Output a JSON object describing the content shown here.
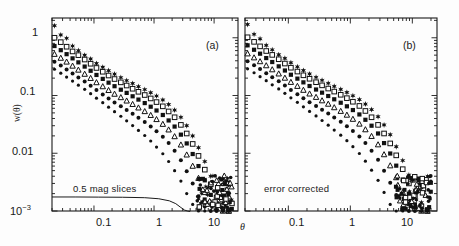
{
  "figure": {
    "background": "#fdfdfd",
    "axis_color": "#1a1a1a",
    "marker_color": "#111111",
    "ylabel": "w(θ)",
    "xlabel": "θ",
    "panel_a_tag": "(a)",
    "panel_b_tag": "(b)",
    "panel_a_annotation": "0.5 mag slices",
    "panel_b_annotation": "error corrected"
  },
  "chart_data": [
    {
      "type": "scatter",
      "panel": "a",
      "title": "",
      "subtitle": "0.5 mag slices",
      "xlabel": "θ",
      "ylabel": "w(θ)",
      "xscale": "log",
      "yscale": "log",
      "xlim": [
        0.02,
        25
      ],
      "ylim": [
        0.001,
        2.2
      ],
      "xtick_labels": [
        "0.1",
        "1",
        "10"
      ],
      "xtick_values": [
        0.1,
        1,
        10
      ],
      "ytick_labels": [
        "1",
        "0.1",
        "0.01",
        "10⁻³"
      ],
      "ytick_values": [
        1,
        0.1,
        0.01,
        0.001
      ],
      "grid": false,
      "legend": "none",
      "annotations": [
        {
          "text": "(a)",
          "x": 6.0,
          "y": 1.1
        },
        {
          "text": "0.5 mag slices",
          "x": 0.075,
          "y": 0.0021
        }
      ],
      "curve_overlay": {
        "name": "random-error-floor",
        "description": "smooth solid line near the bottom of panel (a)",
        "x": [
          0.02,
          0.05,
          0.12,
          0.3,
          0.7,
          1.2,
          1.8,
          2.3,
          2.8,
          3.2,
          3.6,
          4.0
        ],
        "y": [
          0.00175,
          0.00175,
          0.00174,
          0.00173,
          0.0017,
          0.00163,
          0.0015,
          0.00134,
          0.00115,
          0.00104,
          0.001,
          0.00098
        ]
      },
      "series": [
        {
          "name": "series-1",
          "marker": "star",
          "amplitude": 0.0118,
          "x": [
            0.022,
            0.028,
            0.035,
            0.044,
            0.055,
            0.07,
            0.088,
            0.11,
            0.14,
            0.175,
            0.22,
            0.28,
            0.35,
            0.44,
            0.55,
            0.7,
            0.88,
            1.1,
            1.4,
            1.75,
            2.2,
            2.8,
            3.5,
            4.4,
            5.5,
            7.0,
            8.8,
            11.0,
            14.0,
            17.5
          ],
          "y": [
            1.62,
            1.12,
            0.98,
            0.72,
            0.6,
            0.5,
            0.43,
            0.36,
            0.31,
            0.27,
            0.235,
            0.205,
            0.182,
            0.162,
            0.143,
            0.127,
            0.112,
            0.098,
            0.084,
            0.07,
            0.056,
            0.042,
            0.03,
            0.02,
            0.0125,
            0.0072,
            0.004,
            0.0022,
            0.0014,
            0.0011
          ]
        },
        {
          "name": "series-2",
          "marker": "open-square",
          "amplitude": 0.0092,
          "x": [
            0.022,
            0.028,
            0.035,
            0.044,
            0.055,
            0.07,
            0.088,
            0.11,
            0.14,
            0.175,
            0.22,
            0.28,
            0.35,
            0.44,
            0.55,
            0.7,
            0.88,
            1.1,
            1.4,
            1.75,
            2.2,
            2.8,
            3.5,
            4.4,
            5.5,
            7.0,
            8.8,
            11.0,
            14.0,
            17.5
          ],
          "y": [
            1.0,
            0.84,
            0.7,
            0.58,
            0.5,
            0.42,
            0.355,
            0.3,
            0.258,
            0.222,
            0.193,
            0.169,
            0.149,
            0.131,
            0.116,
            0.102,
            0.089,
            0.077,
            0.065,
            0.053,
            0.042,
            0.031,
            0.022,
            0.0145,
            0.009,
            0.0052,
            0.0029,
            0.0017,
            0.0012,
            0.001
          ]
        },
        {
          "name": "series-3",
          "marker": "filled-square",
          "amplitude": 0.0072,
          "x": [
            0.022,
            0.028,
            0.035,
            0.044,
            0.055,
            0.07,
            0.088,
            0.11,
            0.14,
            0.175,
            0.22,
            0.28,
            0.35,
            0.44,
            0.55,
            0.7,
            0.88,
            1.1,
            1.4,
            1.75,
            2.2,
            2.8,
            3.5,
            4.4,
            5.5,
            7.0,
            8.8,
            11.0,
            14.0,
            17.5
          ],
          "y": [
            0.72,
            0.61,
            0.52,
            0.44,
            0.375,
            0.317,
            0.268,
            0.227,
            0.194,
            0.167,
            0.145,
            0.126,
            0.111,
            0.097,
            0.085,
            0.074,
            0.064,
            0.055,
            0.046,
            0.037,
            0.029,
            0.021,
            0.0148,
            0.0097,
            0.006,
            0.0034,
            0.0019,
            0.0013,
            0.0011,
            0.001
          ]
        },
        {
          "name": "series-4",
          "marker": "open-triangle",
          "amplitude": 0.0054,
          "x": [
            0.022,
            0.028,
            0.035,
            0.044,
            0.055,
            0.07,
            0.088,
            0.11,
            0.14,
            0.175,
            0.22,
            0.28,
            0.35,
            0.44,
            0.55,
            0.7,
            0.88,
            1.1,
            1.4,
            1.75,
            2.2,
            2.8,
            3.5,
            4.4,
            5.5,
            7.0,
            8.8,
            11.0,
            14.0,
            17.5
          ],
          "y": [
            0.52,
            0.445,
            0.382,
            0.325,
            0.277,
            0.235,
            0.199,
            0.168,
            0.143,
            0.123,
            0.106,
            0.0925,
            0.0808,
            0.0705,
            0.0613,
            0.053,
            0.0455,
            0.0386,
            0.0319,
            0.0255,
            0.0195,
            0.014,
            0.0094,
            0.006,
            0.0037,
            0.0021,
            0.0014,
            0.0011,
            0.001,
            0.001
          ]
        },
        {
          "name": "series-5",
          "marker": "filled-circle",
          "amplitude": 0.004,
          "x": [
            0.022,
            0.028,
            0.035,
            0.044,
            0.055,
            0.07,
            0.088,
            0.11,
            0.14,
            0.175,
            0.22,
            0.28,
            0.35,
            0.44,
            0.55,
            0.7,
            0.88,
            1.1,
            1.4,
            1.75,
            2.2,
            2.8,
            3.5,
            4.4,
            5.5,
            7.0,
            8.8,
            11.0,
            14.0,
            17.5
          ],
          "y": [
            0.385,
            0.33,
            0.283,
            0.241,
            0.205,
            0.174,
            0.147,
            0.124,
            0.1045,
            0.0888,
            0.0757,
            0.065,
            0.056,
            0.0481,
            0.0411,
            0.0348,
            0.0292,
            0.0241,
            0.0194,
            0.015,
            0.011,
            0.0076,
            0.0049,
            0.003,
            0.0018,
            0.0012,
            0.001,
            0.001,
            0.001,
            0.001
          ]
        },
        {
          "name": "series-6",
          "marker": "filled-circle-small",
          "amplitude": 0.0029,
          "x": [
            0.022,
            0.028,
            0.035,
            0.044,
            0.055,
            0.07,
            0.088,
            0.11,
            0.14,
            0.175,
            0.22,
            0.28,
            0.35,
            0.44,
            0.55,
            0.7,
            0.88,
            1.1,
            1.4,
            1.75,
            2.2,
            2.8,
            3.5,
            4.4,
            5.5,
            7.0
          ],
          "y": [
            0.285,
            0.244,
            0.209,
            0.178,
            0.151,
            0.128,
            0.1075,
            0.09,
            0.0752,
            0.0628,
            0.0524,
            0.0437,
            0.0364,
            0.0302,
            0.0249,
            0.0203,
            0.0163,
            0.0128,
            0.0098,
            0.0072,
            0.005,
            0.0033,
            0.002,
            0.0013,
            0.001,
            0.001
          ]
        }
      ]
    },
    {
      "type": "scatter",
      "panel": "b",
      "title": "",
      "subtitle": "error corrected",
      "xlabel": "θ",
      "ylabel": "w(θ)",
      "xscale": "log",
      "yscale": "log",
      "xlim": [
        0.02,
        25
      ],
      "ylim": [
        0.001,
        2.2
      ],
      "xtick_labels": [
        "0.1",
        "1",
        "10"
      ],
      "xtick_values": [
        0.1,
        1,
        10
      ],
      "ytick_labels": [
        "1",
        "0.1",
        "0.01",
        "10⁻³"
      ],
      "ytick_values": [
        1,
        0.1,
        0.01,
        0.001
      ],
      "grid": false,
      "legend": "none",
      "annotations": [
        {
          "text": "(b)",
          "x": 6.0,
          "y": 1.1
        },
        {
          "text": "error corrected",
          "x": 0.075,
          "y": 0.0021
        }
      ],
      "series": [
        {
          "name": "series-1",
          "marker": "star",
          "amplitude": 0.0118,
          "x": [
            0.022,
            0.028,
            0.035,
            0.044,
            0.055,
            0.07,
            0.088,
            0.11,
            0.14,
            0.175,
            0.22,
            0.28,
            0.35,
            0.44,
            0.55,
            0.7,
            0.88,
            1.1,
            1.4,
            1.75,
            2.2,
            2.8,
            3.5,
            4.4,
            5.5,
            7.0,
            8.8,
            11.0,
            14.0,
            17.5
          ],
          "y": [
            1.7,
            1.15,
            0.96,
            0.74,
            0.62,
            0.51,
            0.44,
            0.37,
            0.315,
            0.272,
            0.237,
            0.207,
            0.184,
            0.163,
            0.144,
            0.128,
            0.113,
            0.099,
            0.085,
            0.071,
            0.057,
            0.043,
            0.031,
            0.021,
            0.013,
            0.0075,
            0.0042,
            0.0023,
            0.0014,
            0.0011
          ]
        },
        {
          "name": "series-2",
          "marker": "open-square",
          "amplitude": 0.0092,
          "x": [
            0.022,
            0.028,
            0.035,
            0.044,
            0.055,
            0.07,
            0.088,
            0.11,
            0.14,
            0.175,
            0.22,
            0.28,
            0.35,
            0.44,
            0.55,
            0.7,
            0.88,
            1.1,
            1.4,
            1.75,
            2.2,
            2.8,
            3.5,
            4.4,
            5.5,
            7.0,
            8.8,
            11.0,
            14.0,
            17.5
          ],
          "y": [
            1.02,
            0.85,
            0.71,
            0.59,
            0.505,
            0.425,
            0.358,
            0.303,
            0.26,
            0.224,
            0.195,
            0.17,
            0.15,
            0.132,
            0.117,
            0.103,
            0.09,
            0.078,
            0.066,
            0.054,
            0.042,
            0.031,
            0.022,
            0.0148,
            0.0092,
            0.0053,
            0.003,
            0.0018,
            0.0012,
            0.001
          ]
        },
        {
          "name": "series-3",
          "marker": "filled-square",
          "amplitude": 0.0072,
          "x": [
            0.022,
            0.028,
            0.035,
            0.044,
            0.055,
            0.07,
            0.088,
            0.11,
            0.14,
            0.175,
            0.22,
            0.28,
            0.35,
            0.44,
            0.55,
            0.7,
            0.88,
            1.1,
            1.4,
            1.75,
            2.2,
            2.8,
            3.5,
            4.4,
            5.5,
            7.0,
            8.8,
            11.0,
            14.0,
            17.5
          ],
          "y": [
            0.74,
            0.62,
            0.53,
            0.445,
            0.38,
            0.32,
            0.271,
            0.229,
            0.196,
            0.169,
            0.146,
            0.127,
            0.112,
            0.098,
            0.086,
            0.075,
            0.065,
            0.056,
            0.047,
            0.038,
            0.03,
            0.022,
            0.015,
            0.0099,
            0.0061,
            0.0035,
            0.002,
            0.0013,
            0.0011,
            0.001
          ]
        },
        {
          "name": "series-4",
          "marker": "open-triangle",
          "amplitude": 0.0054,
          "x": [
            0.022,
            0.028,
            0.035,
            0.044,
            0.055,
            0.07,
            0.088,
            0.11,
            0.14,
            0.175,
            0.22,
            0.28,
            0.35,
            0.44,
            0.55,
            0.7,
            0.88,
            1.1,
            1.4,
            1.75,
            2.2,
            2.8,
            3.5,
            4.4,
            5.5,
            7.0,
            8.8,
            11.0,
            14.0,
            17.5
          ],
          "y": [
            0.53,
            0.452,
            0.388,
            0.33,
            0.281,
            0.238,
            0.201,
            0.17,
            0.145,
            0.124,
            0.107,
            0.0935,
            0.0816,
            0.0712,
            0.0619,
            0.0535,
            0.046,
            0.039,
            0.0322,
            0.0257,
            0.0197,
            0.0141,
            0.0095,
            0.0061,
            0.0038,
            0.0021,
            0.0014,
            0.0011,
            0.001,
            0.001
          ]
        },
        {
          "name": "series-5",
          "marker": "filled-circle",
          "amplitude": 0.004,
          "x": [
            0.022,
            0.028,
            0.035,
            0.044,
            0.055,
            0.07,
            0.088,
            0.11,
            0.14,
            0.175,
            0.22,
            0.28,
            0.35,
            0.44,
            0.55,
            0.7,
            0.88,
            1.1,
            1.4,
            1.75,
            2.2,
            2.8,
            3.5,
            4.4,
            5.5,
            7.0,
            8.8,
            11.0,
            14.0,
            17.5
          ],
          "y": [
            0.392,
            0.335,
            0.287,
            0.244,
            0.208,
            0.176,
            0.149,
            0.125,
            0.1056,
            0.0897,
            0.0765,
            0.0657,
            0.0566,
            0.0486,
            0.0415,
            0.0352,
            0.0295,
            0.0243,
            0.0196,
            0.0151,
            0.0111,
            0.0077,
            0.005,
            0.0031,
            0.0019,
            0.0012,
            0.001,
            0.001,
            0.001,
            0.001
          ]
        },
        {
          "name": "series-6",
          "marker": "filled-circle-small",
          "amplitude": 0.0029,
          "x": [
            0.022,
            0.028,
            0.035,
            0.044,
            0.055,
            0.07,
            0.088,
            0.11,
            0.14,
            0.175,
            0.22,
            0.28,
            0.35,
            0.44,
            0.55,
            0.7,
            0.88,
            1.1,
            1.4,
            1.75,
            2.2,
            2.8,
            3.5,
            4.4,
            5.5,
            7.0
          ],
          "y": [
            0.29,
            0.248,
            0.212,
            0.181,
            0.153,
            0.13,
            0.109,
            0.0912,
            0.0762,
            0.0636,
            0.0531,
            0.0443,
            0.0369,
            0.0306,
            0.0252,
            0.0206,
            0.0165,
            0.013,
            0.0099,
            0.0073,
            0.0051,
            0.0034,
            0.0021,
            0.0013,
            0.001,
            0.001
          ]
        }
      ]
    }
  ]
}
